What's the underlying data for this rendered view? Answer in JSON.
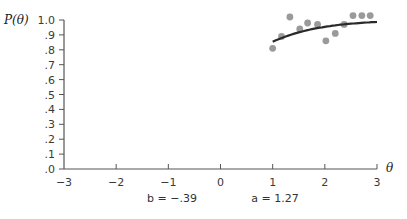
{
  "chart_data": {
    "type": "scatter",
    "title": "",
    "xlabel": "θ",
    "ylabel": "P(θ)",
    "xlim": [
      -3,
      3
    ],
    "ylim": [
      0,
      1.0
    ],
    "grid": false,
    "x_ticks": [
      "−3",
      "−2",
      "−1",
      "0",
      "1",
      "2",
      "3"
    ],
    "y_ticks": [
      ".0",
      ".1",
      ".2",
      ".3",
      ".4",
      ".5",
      ".6",
      ".7",
      ".8",
      ".9",
      "1.0"
    ],
    "series": [
      {
        "name": "observed proportions",
        "kind": "scatter",
        "color": "#9a9a9a",
        "x": [
          1.0,
          1.17,
          1.33,
          1.52,
          1.67,
          1.86,
          2.02,
          2.2,
          2.37,
          2.54,
          2.71,
          2.87
        ],
        "y": [
          0.81,
          0.89,
          1.02,
          0.94,
          0.98,
          0.97,
          0.86,
          0.91,
          0.97,
          1.03,
          1.03,
          1.03
        ]
      },
      {
        "name": "fitted ICC",
        "kind": "line",
        "color": "#2a2a2a",
        "model": "logistic",
        "b": -0.39,
        "a": 1.27,
        "x_range": [
          1.0,
          3.0
        ]
      }
    ],
    "annotations": [
      {
        "text": "b = −.39"
      },
      {
        "text": "a = 1.27"
      }
    ]
  },
  "labels": {
    "y_title": "P(θ)",
    "x_title": "θ",
    "b_param": "b = −.39",
    "a_param": "a = 1.27"
  }
}
